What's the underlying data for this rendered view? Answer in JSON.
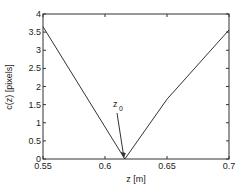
{
  "chart_data": {
    "type": "line",
    "title": "",
    "xlabel": "z [m]",
    "ylabel": "c(z) [pixels]",
    "xlim": [
      0.55,
      0.7
    ],
    "ylim": [
      0,
      4
    ],
    "grid": false,
    "x_ticks": [
      "0.55",
      "0.6",
      "0.65",
      "0.7"
    ],
    "y_ticks": [
      "0",
      "0.5",
      "1",
      "1.5",
      "2",
      "2.5",
      "3",
      "3.5",
      "4"
    ],
    "series": [
      {
        "name": "c(z)",
        "x": [
          0.55,
          0.616,
          0.65,
          0.7
        ],
        "y": [
          3.65,
          0.0,
          1.65,
          3.56
        ]
      }
    ],
    "annotations": [
      {
        "text": "z",
        "subscript": "0",
        "points_to": [
          0.616,
          0.0
        ]
      }
    ],
    "line_color": "#333333"
  }
}
